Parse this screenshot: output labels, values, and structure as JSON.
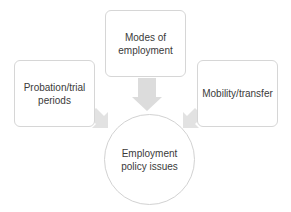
{
  "diagram": {
    "type": "hub-and-spoke",
    "center": {
      "label_line1": "Employment",
      "label_line2": "policy issues"
    },
    "nodes": [
      {
        "id": "top",
        "label_line1": "Modes of",
        "label_line2": "employment"
      },
      {
        "id": "left",
        "label_line1": "Probation/trial",
        "label_line2": "periods"
      },
      {
        "id": "right",
        "label_line1": "Mobility/transfer",
        "label_line2": ""
      }
    ],
    "edges": [
      {
        "from": "top",
        "to": "center"
      },
      {
        "from": "left",
        "to": "center"
      },
      {
        "from": "right",
        "to": "center"
      }
    ],
    "colors": {
      "box_border": "#d6d6d6",
      "arrow_fill": "#dcdcdc",
      "text": "#3a3a3a",
      "background": "#ffffff"
    }
  }
}
